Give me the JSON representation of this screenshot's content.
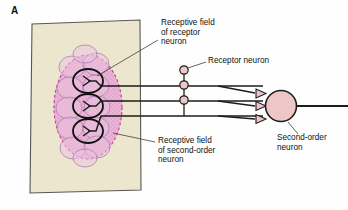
{
  "figure": {
    "panel_letter": "A",
    "type": "biology-schematic"
  },
  "labels": {
    "receptive_field_receptor": "Receptive field\nof receptor\nneuron",
    "receptor_neuron": "Receptor neuron",
    "receptive_field_second_order": "Receptive field\nof second-order\nneuron",
    "second_order_neuron": "Second-order\nneuron"
  },
  "colors": {
    "skin_patch_fill": "#ece6ce",
    "skin_patch_stroke": "#5a5750",
    "receptive_field_fill": "#e7aed3",
    "receptive_field_stroke": "#c06ba8",
    "cell_fill": "#edc2de",
    "cell_stroke": "#a97fb5",
    "soma_fill": "#edc6c8",
    "soma_stroke": "#2b2b2b",
    "neuron_line": "#1c1c1c",
    "label_text": "#111111",
    "leader_line": "#4a4a4a"
  },
  "diagram": {
    "skin_patch": {
      "name": "skin-patch",
      "points": "32,24 140,20 141,190 30,193"
    },
    "second_order_receptive_field": {
      "name": "second-order-receptive-field",
      "cx": 88,
      "cy": 107,
      "rx": 34,
      "ry": 52
    },
    "receptor_receptive_fields": [
      {
        "cx": 88,
        "cy": 81,
        "rx": 15,
        "ry": 12
      },
      {
        "cx": 88,
        "cy": 106,
        "rx": 15,
        "ry": 12
      },
      {
        "cx": 88,
        "cy": 131,
        "rx": 15,
        "ry": 12
      }
    ],
    "receptor_neurons": [
      {
        "name": "receptor-neuron-1",
        "axon_y": 86,
        "soma_cx": 184,
        "soma_cy": 71,
        "stalk_x": 184
      },
      {
        "name": "receptor-neuron-2",
        "axon_y": 101,
        "soma_cx": 184,
        "soma_cy": 86,
        "stalk_x": 184
      },
      {
        "name": "receptor-neuron-3",
        "axon_y": 116,
        "soma_cx": 184,
        "soma_cy": 101,
        "stalk_x": 184
      }
    ],
    "second_order_neuron": {
      "name": "second-order-neuron",
      "soma_cx": 281,
      "soma_cy": 106,
      "r": 15,
      "axon_x2": 348
    },
    "synapses": [
      {
        "name": "synapse-1",
        "x": 263,
        "y": 93
      },
      {
        "name": "synapse-2",
        "x": 263,
        "y": 106
      },
      {
        "name": "synapse-3",
        "x": 263,
        "y": 119
      }
    ]
  },
  "label_positions": {
    "receptive_field_receptor": {
      "x": 161,
      "y": 20
    },
    "receptor_neuron": {
      "x": 208,
      "y": 60
    },
    "receptive_field_second_order": {
      "x": 158,
      "y": 140
    },
    "second_order_neuron": {
      "x": 277,
      "y": 136
    },
    "panel_letter": {
      "x": 11,
      "y": 6
    }
  }
}
